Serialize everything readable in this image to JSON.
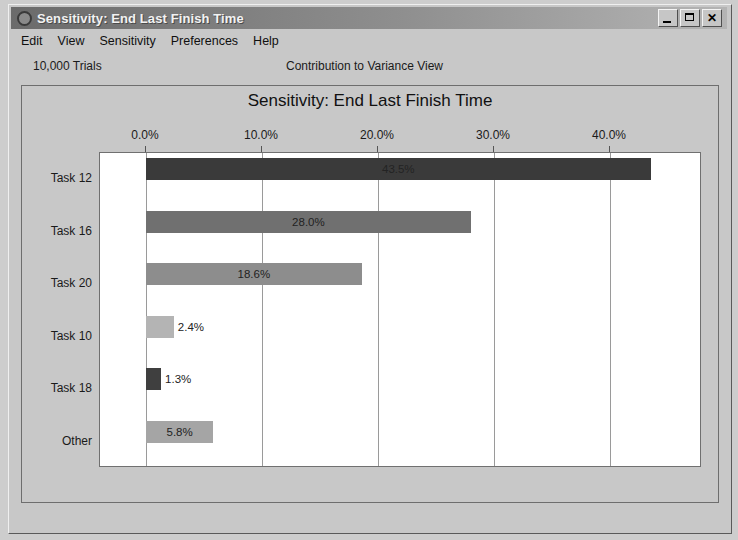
{
  "window": {
    "title": "Sensitivity: End Last Finish Time",
    "icon": "crystal-ball-icon",
    "buttons": {
      "minimize": "_",
      "maximize": "□",
      "close": "✕"
    }
  },
  "menu": {
    "items": [
      {
        "label": "Edit"
      },
      {
        "label": "View"
      },
      {
        "label": "Sensitivity"
      },
      {
        "label": "Preferences"
      },
      {
        "label": "Help"
      }
    ]
  },
  "subheader": {
    "trials": "10,000 Trials",
    "view_name": "Contribution to Variance View"
  },
  "colors": {
    "window_face": "#c8c8c8",
    "plot_background": "#ffffff",
    "gridline": "#9a9a9a",
    "title_bar_left": "#6b6b6b",
    "title_text": "#f2f2f2"
  },
  "chart_data": {
    "type": "bar",
    "orientation": "horizontal",
    "title": "Sensitivity: End Last Finish Time",
    "xlabel": "",
    "ylabel": "",
    "xlim": [
      0,
      45.5
    ],
    "grid": true,
    "legend": "none",
    "tick_labels": [
      "0.0%",
      "10.0%",
      "20.0%",
      "30.0%",
      "40.0%"
    ],
    "tick_values": [
      0,
      10,
      20,
      30,
      40
    ],
    "categories": [
      "Task 12",
      "Task 16",
      "Task 20",
      "Task 10",
      "Task 18",
      "Other"
    ],
    "values": [
      43.5,
      28.0,
      18.6,
      2.4,
      1.3,
      5.8
    ],
    "value_labels": [
      "43.5%",
      "28.0%",
      "18.6%",
      "2.4%",
      "1.3%",
      "5.8%"
    ],
    "bar_colors": [
      "#3a3a3a",
      "#707070",
      "#8d8d8d",
      "#b4b4b4",
      "#3f3f3f",
      "#a5a5a5"
    ],
    "label_colors": [
      "#2b2b2b",
      "#2b2b2b",
      "#2b2b2b",
      "#2b2b2b",
      "#2b2b2b",
      "#2b2b2b"
    ],
    "label_inside": [
      true,
      true,
      true,
      false,
      false,
      true
    ]
  }
}
